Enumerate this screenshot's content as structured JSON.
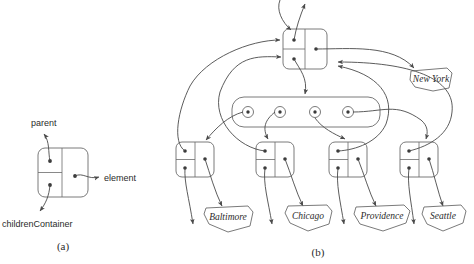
{
  "figure": {
    "caption_a": "(a)",
    "caption_b": "(b)",
    "field_labels": {
      "parent": "parent",
      "element": "element",
      "children_container": "childrenContainer"
    },
    "colors": {
      "stroke": "#4a4a4a",
      "box_stroke": "#6b6b6b",
      "dot": "#3a3a3a",
      "text": "#2b2b2b",
      "background": "#ffffff"
    }
  },
  "panel_a": {
    "name": "node-structure-legend",
    "node_fields": [
      "parent",
      "element",
      "childrenContainer"
    ],
    "caption": "(a)"
  },
  "panel_b": {
    "name": "tree-of-nodes",
    "caption": "(b)",
    "root": {
      "label": "New York",
      "element_label": "New York"
    },
    "children_container": {
      "cell_count": 4
    },
    "children": [
      {
        "label": "Baltimore"
      },
      {
        "label": "Chicago"
      },
      {
        "label": "Providence"
      },
      {
        "label": "Seattle"
      }
    ]
  }
}
